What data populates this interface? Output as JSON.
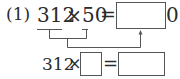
{
  "problem": {
    "label": "(1)",
    "line1": {
      "operand_a": "312",
      "operator": "×",
      "operand_b": "50",
      "equals": "=",
      "answer_suffix": "0"
    },
    "line2": {
      "operand_a": "312",
      "operator": "×",
      "equals": "="
    }
  },
  "colors": {
    "text": "#2a2a2a",
    "lines": "#555555"
  }
}
